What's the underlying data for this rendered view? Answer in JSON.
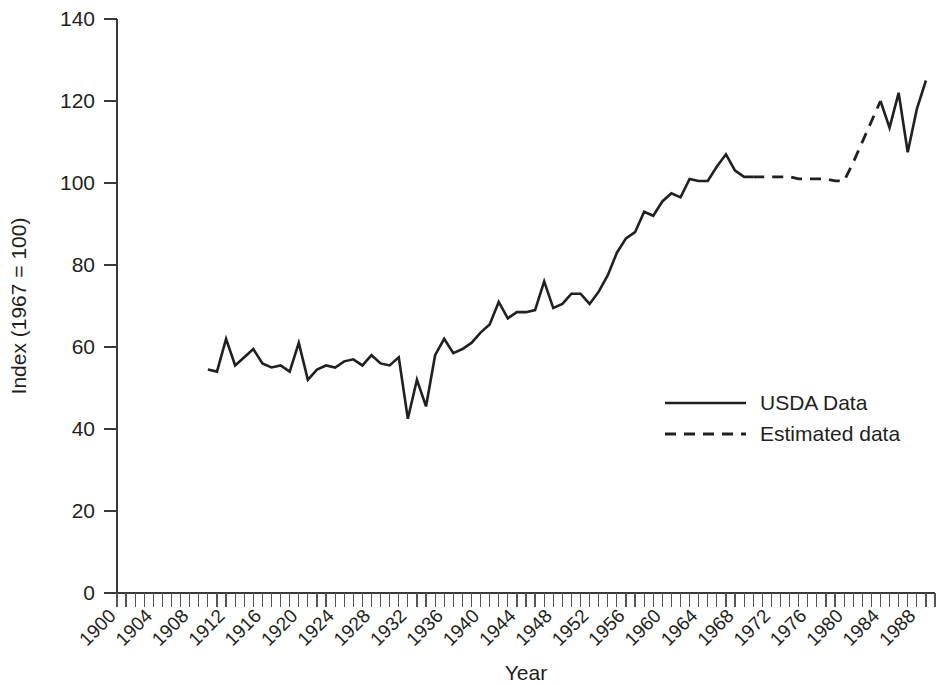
{
  "chart_data": {
    "type": "line",
    "title": "",
    "xlabel": "Year",
    "ylabel": "Index (1967 = 100)",
    "xlim": [
      1900,
      1990
    ],
    "ylim": [
      0,
      140
    ],
    "y_ticks": [
      0,
      20,
      40,
      60,
      80,
      100,
      120,
      140
    ],
    "x_ticks": [
      1900,
      1904,
      1908,
      1912,
      1916,
      1920,
      1924,
      1928,
      1932,
      1936,
      1940,
      1944,
      1948,
      1952,
      1956,
      1960,
      1964,
      1968,
      1972,
      1976,
      1980,
      1984,
      1988
    ],
    "x_minor_tick_step": 1,
    "grid": false,
    "legend_position": "center-right",
    "legend": [
      {
        "name": "USDA Data",
        "style": "solid"
      },
      {
        "name": "Estimated data",
        "style": "dashed"
      }
    ],
    "series": [
      {
        "name": "USDA Data",
        "style": "solid",
        "x": [
          1910,
          1911,
          1912,
          1913,
          1914,
          1915,
          1916,
          1917,
          1918,
          1919,
          1920,
          1921,
          1922,
          1923,
          1924,
          1925,
          1926,
          1927,
          1928,
          1929,
          1930,
          1931,
          1932,
          1933,
          1934,
          1935,
          1936,
          1937,
          1938,
          1939,
          1940,
          1941,
          1942,
          1943,
          1944,
          1945,
          1946,
          1947,
          1948,
          1949,
          1950,
          1951,
          1952,
          1953,
          1954,
          1955,
          1956,
          1957,
          1958,
          1959,
          1960,
          1961,
          1962,
          1963,
          1964,
          1965,
          1966,
          1967,
          1968,
          1969,
          1970
        ],
        "y": [
          54.5,
          54.0,
          62.0,
          55.5,
          57.5,
          59.5,
          56.0,
          55.0,
          55.5,
          54.0,
          61.0,
          52.0,
          54.5,
          55.5,
          55.0,
          56.5,
          57.0,
          55.5,
          58.0,
          56.0,
          55.5,
          57.5,
          42.5,
          52.0,
          45.5,
          58.0,
          62.0,
          58.5,
          59.5,
          61.0,
          63.5,
          65.5,
          71.0,
          67.0,
          68.5,
          68.5,
          69.0,
          76.0,
          69.5,
          70.5,
          73.0,
          73.0,
          70.5,
          73.5,
          77.5,
          83.0,
          86.5,
          88.0,
          93.0,
          92.0,
          95.5,
          97.5,
          96.5,
          101.0,
          100.5,
          100.5,
          104.0,
          107.0,
          103.0,
          101.5,
          101.5
        ]
      },
      {
        "name": "Estimated data",
        "style": "dashed",
        "x": [
          1970,
          1971,
          1972,
          1973,
          1974,
          1975,
          1976,
          1977,
          1978,
          1979,
          1980,
          1981,
          1982,
          1983,
          1984
        ],
        "y": [
          101.5,
          101.5,
          101.5,
          101.5,
          101.5,
          101.0,
          101.0,
          101.0,
          101.0,
          100.5,
          100.5,
          105.0,
          110.0,
          115.0,
          120.0
        ]
      },
      {
        "name": "USDA Data",
        "style": "solid",
        "x": [
          1984,
          1985,
          1986,
          1987,
          1988,
          1989
        ],
        "y": [
          120.0,
          113.5,
          122.0,
          107.5,
          118.0,
          125.0
        ]
      }
    ]
  },
  "axes": {
    "y_title": "Index (1967 = 100)",
    "x_title": "Year"
  }
}
